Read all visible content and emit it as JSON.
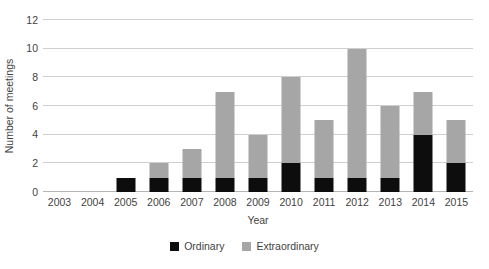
{
  "chart_data": {
    "type": "bar",
    "subtype": "stacked-vertical",
    "title": "",
    "xlabel": "Year",
    "ylabel": "Number of meetings",
    "categories": [
      "2003",
      "2004",
      "2005",
      "2006",
      "2007",
      "2008",
      "2009",
      "2010",
      "2011",
      "2012",
      "2013",
      "2014",
      "2015"
    ],
    "series": [
      {
        "name": "Ordinary",
        "color": "#0d0d0d",
        "values": [
          0,
          0,
          1,
          1,
          1,
          1,
          1,
          2,
          1,
          1,
          1,
          4,
          2
        ]
      },
      {
        "name": "Extraordinary",
        "color": "#a6a6a6",
        "values": [
          0,
          0,
          0,
          1,
          2,
          6,
          3,
          6,
          4,
          9,
          5,
          3,
          3
        ]
      }
    ],
    "totals": [
      0,
      0,
      1,
      2,
      3,
      7,
      4,
      8,
      5,
      10,
      6,
      7,
      5
    ],
    "ylim": [
      0,
      12
    ],
    "ytick_values": [
      0,
      2,
      4,
      6,
      8,
      10,
      12
    ],
    "ytick_labels": [
      "0",
      "2",
      "4",
      "6",
      "8",
      "10",
      "12"
    ],
    "grid": "horizontal",
    "legend_position": "bottom-center",
    "background_color": "#ffffff",
    "gridline_color": "#cfcfcf",
    "text_color": "#3f3f3f"
  },
  "legend": {
    "items": [
      {
        "label": "Ordinary",
        "color": "#0d0d0d"
      },
      {
        "label": "Extraordinary",
        "color": "#a6a6a6"
      }
    ]
  }
}
